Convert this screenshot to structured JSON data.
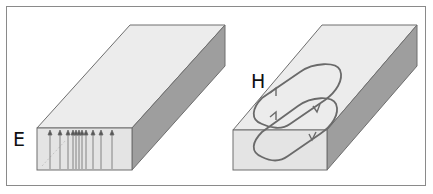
{
  "figure": {
    "panels": [
      {
        "id": "left",
        "label": "E",
        "description": "Rectangular slab with vertical electric field lines on front face",
        "field_arrow_x": [
          50,
          60,
          68,
          73,
          76,
          79,
          82,
          86,
          93,
          101,
          112
        ]
      },
      {
        "id": "right",
        "label": "H",
        "description": "Rectangular slab with closed magnetic field loops"
      }
    ],
    "colors": {
      "top_face": "#ececec",
      "front_face": "#e4e4e4",
      "side_face": "#9e9e9e",
      "edge": "#6e6e6e",
      "field_line": "#6a6a6a",
      "frame": "#8a8a8a"
    }
  }
}
